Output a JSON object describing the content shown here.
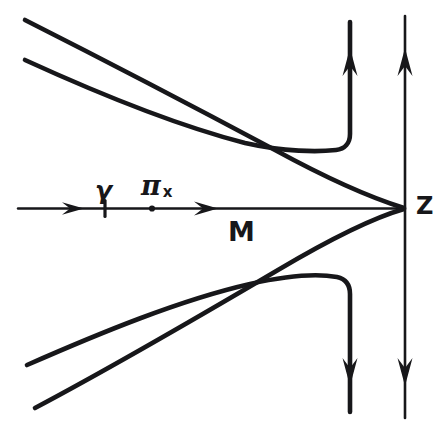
{
  "figure": {
    "background_color": "#ffffff",
    "ink_color": "#17171a",
    "width": 447,
    "height": 432,
    "labels": {
      "gamma": "γ",
      "pi": "π",
      "pi_subscript": "x",
      "m": "M",
      "z": "Z"
    },
    "markers": [
      {
        "name": "gamma-point",
        "x": 105,
        "y": 208
      },
      {
        "name": "pi-x-point",
        "x": 152,
        "y": 208
      },
      {
        "name": "convergence-point-z",
        "x": 405,
        "y": 208
      }
    ],
    "axes": {
      "horizontal": {
        "y": 208,
        "x_start": 18,
        "x_end": 405,
        "arrowheads_at": [
          80,
          215
        ]
      },
      "vertical_inner": {
        "x": 350,
        "y_top": 14,
        "y_bottom": 420
      },
      "vertical_outer": {
        "x": 405,
        "y_top": 14,
        "y_bottom": 420
      }
    },
    "curves": [
      {
        "name": "upper-outer-branch",
        "start": [
          25,
          20
        ],
        "end": [
          405,
          208
        ]
      },
      {
        "name": "upper-inner-branch-with-hook",
        "start": [
          25,
          60
        ],
        "hook_at": [
          350,
          148
        ],
        "hook_to": [
          350,
          20
        ]
      },
      {
        "name": "lower-inner-branch-with-hook",
        "start": [
          27,
          365
        ],
        "hook_at": [
          350,
          278
        ],
        "hook_to": [
          350,
          415
        ]
      },
      {
        "name": "lower-outer-branch",
        "start": [
          35,
          408
        ],
        "end": [
          405,
          208
        ]
      }
    ]
  }
}
